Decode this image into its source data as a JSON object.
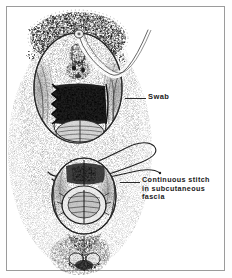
{
  "figure": {
    "kind": "medical-line-illustration",
    "style": "black and white stipple and hatch pen drawing",
    "background_color": "#ffffff",
    "ink_color": "#1a1a1a",
    "frame": {
      "visible": true,
      "color": "#9b9b9b",
      "inset_px": 6
    }
  },
  "annotations": [
    {
      "id": "swab",
      "text": "Swab",
      "lines": [
        "Swab"
      ],
      "leader_line": true,
      "points_to": "white gauze swab packed in upper wound cavity"
    },
    {
      "id": "continuous-stitch",
      "text": "Continuous  stitch\nin  subcutaneous\nfascia",
      "lines": [
        "Continuous  stitch",
        "in  subcutaneous",
        "fascia"
      ],
      "leader_line": true,
      "points_to": "suture threads looping out of lower wound edge"
    }
  ]
}
